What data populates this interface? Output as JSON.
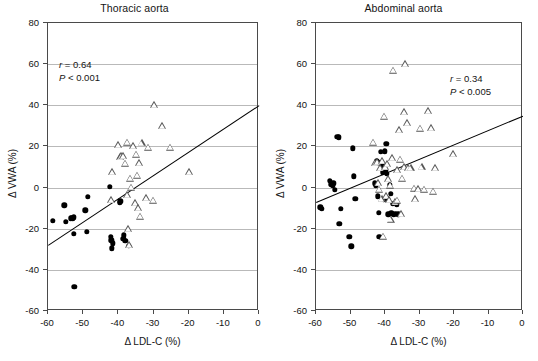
{
  "figure": {
    "axis_labels": {
      "x": "Δ LDL-C (%)",
      "y": "Δ VWA (%)"
    }
  },
  "chart_data": [
    {
      "type": "scatter",
      "title": "Thoracic aorta",
      "xlabel": "Δ LDL-C (%)",
      "ylabel": "Δ VWA (%)",
      "xlim": [
        -60,
        0
      ],
      "ylim": [
        -60,
        80
      ],
      "xticks": [
        -60,
        -50,
        -40,
        -30,
        -20,
        -10,
        0
      ],
      "yticks": [
        -60,
        -40,
        -20,
        0,
        20,
        40,
        60,
        80
      ],
      "grid": "horizontal",
      "legend": "none",
      "annotations": {
        "r": "r = 0.64",
        "p": "P < 0.001",
        "r_value": 0.64,
        "p_text": "< 0.001"
      },
      "fit_line": {
        "x0": -60,
        "y0": -28,
        "x1": 0,
        "y1": 40
      },
      "series": [
        {
          "name": "filled-circle",
          "marker": "dot",
          "points": [
            [
              -58.6,
              -16.2
            ],
            [
              -55.4,
              -8.6
            ],
            [
              -55.0,
              -16.5
            ],
            [
              -53.6,
              -15.0
            ],
            [
              -53.2,
              -14.6
            ],
            [
              -53.0,
              -15.2
            ],
            [
              -52.6,
              -14.4
            ],
            [
              -52.6,
              -22.4
            ],
            [
              -52.5,
              -48.2
            ],
            [
              -49.4,
              -11.0
            ],
            [
              -49.0,
              -21.4
            ],
            [
              -48.6,
              -4.6
            ],
            [
              -42.4,
              0.3
            ],
            [
              -42.2,
              -24.0
            ],
            [
              -42.0,
              -25.6
            ],
            [
              -41.8,
              -29.6
            ],
            [
              -41.6,
              -27.0
            ],
            [
              -39.6,
              -7.4
            ],
            [
              -39.4,
              -6.6
            ],
            [
              -38.6,
              -25.0
            ],
            [
              -38.4,
              -23.2
            ],
            [
              -38.0,
              -26.0
            ],
            [
              -37.0,
              -28.4
            ]
          ]
        },
        {
          "name": "open-triangle",
          "marker": "tri",
          "points": [
            [
              -42.2,
              -6.2
            ],
            [
              -41.8,
              7.6
            ],
            [
              -40.0,
              20.6
            ],
            [
              -39.6,
              14.8
            ],
            [
              -39.2,
              15.4
            ],
            [
              -38.6,
              15.2
            ],
            [
              -38.2,
              11.6
            ],
            [
              -37.6,
              21.8
            ],
            [
              -37.4,
              -3.6
            ],
            [
              -37.2,
              -20.2
            ],
            [
              -37.0,
              -28.0
            ],
            [
              -36.6,
              4.4
            ],
            [
              -36.4,
              0.0
            ],
            [
              -35.8,
              20.0
            ],
            [
              -35.2,
              -7.6
            ],
            [
              -35.0,
              16.0
            ],
            [
              -34.6,
              5.8
            ],
            [
              -34.4,
              -10.0
            ],
            [
              -34.0,
              11.8
            ],
            [
              -33.8,
              -14.2
            ],
            [
              -33.4,
              21.6
            ],
            [
              -32.0,
              -5.0
            ],
            [
              -31.6,
              19.4
            ],
            [
              -30.2,
              -6.4
            ],
            [
              -29.8,
              40.0
            ],
            [
              -27.6,
              30.0
            ],
            [
              -25.2,
              19.4
            ],
            [
              -19.8,
              7.6
            ]
          ]
        }
      ]
    },
    {
      "type": "scatter",
      "title": "Abdominal aorta",
      "xlabel": "Δ LDL-C (%)",
      "ylabel": "Δ VWA (%)",
      "xlim": [
        -60,
        0
      ],
      "ylim": [
        -60,
        80
      ],
      "xticks": [
        -60,
        -50,
        -40,
        -30,
        -20,
        -10,
        0
      ],
      "yticks": [
        -60,
        -40,
        -20,
        0,
        20,
        40,
        60,
        80
      ],
      "grid": "horizontal",
      "legend": "none",
      "annotations": {
        "r": "r = 0.34",
        "p": "P < 0.005",
        "r_value": 0.34,
        "p_text": "< 0.005"
      },
      "fit_line": {
        "x0": -60,
        "y0": -7,
        "x1": 0,
        "y1": 35
      },
      "series": [
        {
          "name": "filled-circle",
          "marker": "dot",
          "points": [
            [
              -58.8,
              -9.6
            ],
            [
              -58.4,
              -10.4
            ],
            [
              -56.0,
              3.4
            ],
            [
              -55.6,
              1.6
            ],
            [
              -55.2,
              0.8
            ],
            [
              -55.0,
              2.0
            ],
            [
              -54.6,
              -1.0
            ],
            [
              -53.8,
              24.6
            ],
            [
              -53.4,
              24.4
            ],
            [
              -53.2,
              -17.6
            ],
            [
              -52.8,
              -10.2
            ],
            [
              -50.4,
              -23.8
            ],
            [
              -49.8,
              -28.6
            ],
            [
              -49.4,
              19.0
            ],
            [
              -49.0,
              5.4
            ],
            [
              -48.6,
              -5.4
            ],
            [
              -43.0,
              2.0
            ],
            [
              -42.6,
              1.0
            ],
            [
              -42.4,
              13.0
            ],
            [
              -42.2,
              12.2
            ],
            [
              -42.0,
              -4.2
            ],
            [
              -41.8,
              -12.2
            ],
            [
              -41.6,
              -23.8
            ],
            [
              -41.2,
              17.4
            ],
            [
              -40.8,
              10.4
            ],
            [
              -40.6,
              7.4
            ],
            [
              -40.4,
              -6.0
            ],
            [
              -40.0,
              17.6
            ],
            [
              -39.8,
              8.0
            ],
            [
              -39.6,
              21.2
            ],
            [
              -39.4,
              6.6
            ],
            [
              -39.2,
              -5.4
            ],
            [
              -39.0,
              -13.0
            ],
            [
              -38.6,
              1.2
            ],
            [
              -38.4,
              -3.0
            ],
            [
              -38.2,
              -12.6
            ],
            [
              -37.8,
              -7.8
            ],
            [
              -37.4,
              -13.2
            ],
            [
              -37.0,
              -12.8
            ],
            [
              -36.6,
              -8.2
            ],
            [
              -36.2,
              -13.0
            ]
          ]
        },
        {
          "name": "open-triangle",
          "marker": "tri",
          "points": [
            [
              -43.4,
              21.8
            ],
            [
              -42.8,
              11.8
            ],
            [
              -42.4,
              12.4
            ],
            [
              -42.0,
              2.0
            ],
            [
              -41.6,
              -1.0
            ],
            [
              -41.4,
              9.4
            ],
            [
              -41.0,
              -5.6
            ],
            [
              -40.8,
              13.0
            ],
            [
              -40.6,
              -23.8
            ],
            [
              -40.2,
              34.4
            ],
            [
              -40.0,
              9.8
            ],
            [
              -39.8,
              -4.2
            ],
            [
              -39.4,
              11.4
            ],
            [
              -39.0,
              4.2
            ],
            [
              -38.8,
              -6.0
            ],
            [
              -38.6,
              1.0
            ],
            [
              -38.4,
              -15.6
            ],
            [
              -38.0,
              14.2
            ],
            [
              -37.6,
              56.8
            ],
            [
              -37.2,
              -7.0
            ],
            [
              -36.6,
              8.4
            ],
            [
              -36.4,
              -6.4
            ],
            [
              -36.0,
              28.0
            ],
            [
              -35.6,
              13.6
            ],
            [
              -35.4,
              -12.8
            ],
            [
              -35.0,
              4.4
            ],
            [
              -34.6,
              9.8
            ],
            [
              -34.4,
              36.6
            ],
            [
              -34.2,
              60.0
            ],
            [
              -33.6,
              31.2
            ],
            [
              -33.4,
              9.6
            ],
            [
              -32.6,
              9.4
            ],
            [
              -31.6,
              -0.6
            ],
            [
              -31.2,
              -5.6
            ],
            [
              -30.4,
              -0.8
            ],
            [
              -29.8,
              28.6
            ],
            [
              -29.4,
              9.8
            ],
            [
              -28.6,
              -1.0
            ],
            [
              -27.4,
              37.0
            ],
            [
              -26.6,
              28.8
            ],
            [
              -26.2,
              -2.0
            ],
            [
              -25.6,
              9.4
            ],
            [
              -20.2,
              16.2
            ]
          ]
        }
      ]
    }
  ]
}
